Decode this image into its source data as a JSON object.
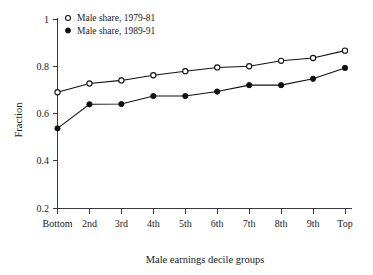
{
  "chart_data": {
    "type": "line",
    "title": "",
    "xlabel": "Male earnings decile groups",
    "ylabel": "Fraction",
    "categories": [
      "Bottom",
      "2nd",
      "3rd",
      "4th",
      "5th",
      "6th",
      "7th",
      "8th",
      "9th",
      "Top"
    ],
    "ylim": [
      0.2,
      1.0
    ],
    "yticks": [
      0.2,
      0.4,
      0.6,
      0.8,
      1
    ],
    "ytick_labels": [
      "0.2",
      "0.4",
      "0.6",
      "0.8",
      "1"
    ],
    "grid": false,
    "legend_position": "top-left",
    "series": [
      {
        "name": "Male share, 1979-81",
        "marker": "open-circle",
        "color": "#111111",
        "values": [
          0.69,
          0.727,
          0.74,
          0.762,
          0.779,
          0.795,
          0.8,
          0.823,
          0.835,
          0.866
        ]
      },
      {
        "name": "Male share, 1989-91",
        "marker": "filled-circle",
        "color": "#111111",
        "values": [
          0.537,
          0.639,
          0.64,
          0.674,
          0.674,
          0.693,
          0.72,
          0.72,
          0.747,
          0.793
        ]
      }
    ]
  },
  "legend": {
    "entries": [
      {
        "label": "Male share, 1979-81",
        "marker": "open-circle"
      },
      {
        "label": "Male share, 1989-91",
        "marker": "filled-circle"
      }
    ]
  },
  "axes": {
    "y_title": "Fraction",
    "x_title": "Male earnings decile groups"
  }
}
